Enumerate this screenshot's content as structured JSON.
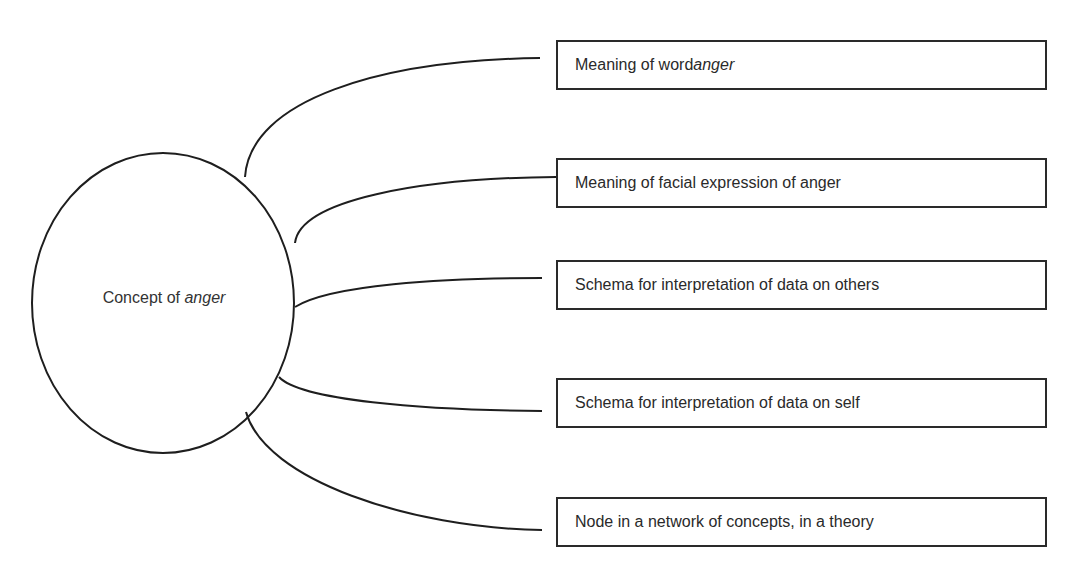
{
  "diagram": {
    "center": {
      "label_prefix": "Concept of ",
      "label_emphasis": "anger"
    },
    "nodes": [
      {
        "label_prefix": "Meaning of word ",
        "label_emphasis": "anger"
      },
      {
        "label_prefix": "Meaning of facial expression of anger",
        "label_emphasis": ""
      },
      {
        "label_prefix": "Schema for interpretation of data on others",
        "label_emphasis": ""
      },
      {
        "label_prefix": "Schema for interpretation of data on self",
        "label_emphasis": ""
      },
      {
        "label_prefix": "Node in a network of concepts, in a theory",
        "label_emphasis": ""
      }
    ],
    "colors": {
      "stroke": "#1e1e1e",
      "text": "#2a2a2a",
      "background": "#ffffff"
    }
  }
}
